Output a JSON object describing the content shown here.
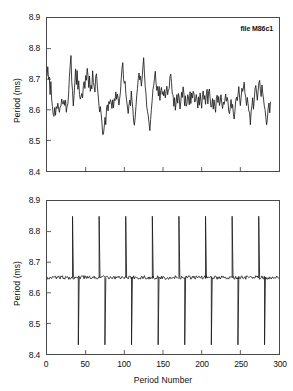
{
  "figure": {
    "background_color": "#ffffff",
    "line_color": "#1a1a1a",
    "axis_color": "#4a4a4a"
  },
  "annotation": {
    "file_label": "file M86c1"
  },
  "axis": {
    "y_title": "Period (ms)",
    "x_title": "Period Number",
    "y_ticks": [
      "8.9",
      "8.8",
      "8.7",
      "8.6",
      "8.5",
      "8.4"
    ],
    "x_ticks": [
      "0",
      "50",
      "100",
      "150",
      "200",
      "250",
      "300"
    ]
  },
  "chart_data": [
    {
      "type": "line",
      "panel": "top",
      "title": "",
      "annotation": "file M86c1",
      "xlabel": "",
      "ylabel": "Period (ms)",
      "xlim": [
        0,
        300
      ],
      "ylim": [
        8.4,
        8.9
      ],
      "yticks": [
        8.4,
        8.5,
        8.6,
        8.7,
        8.8,
        8.9
      ],
      "xticks": [
        0,
        50,
        100,
        150,
        200,
        250,
        300
      ],
      "xtick_labels_visible": false,
      "grid": false,
      "legend": "none",
      "description": "Noisy fluctuating period trace, mean near 8.64 ms, range 8.50 to 8.78 ms",
      "series": [
        {
          "name": "period",
          "x": [
            0,
            1,
            2,
            3,
            4,
            5,
            6,
            7,
            8,
            9,
            10,
            11,
            12,
            13,
            14,
            15,
            16,
            17,
            18,
            19,
            20,
            21,
            22,
            23,
            24,
            25,
            26,
            27,
            28,
            29,
            30,
            31,
            32,
            33,
            34,
            35,
            36,
            37,
            38,
            39,
            40,
            41,
            42,
            43,
            44,
            45,
            46,
            47,
            48,
            49,
            50,
            51,
            52,
            53,
            54,
            55,
            56,
            57,
            58,
            59,
            60,
            61,
            62,
            63,
            64,
            65,
            66,
            67,
            68,
            69,
            70,
            71,
            72,
            73,
            74,
            75,
            76,
            77,
            78,
            79,
            80,
            81,
            82,
            83,
            84,
            85,
            86,
            87,
            88,
            89,
            90,
            91,
            92,
            93,
            94,
            95,
            96,
            97,
            98,
            99,
            100,
            101,
            102,
            103,
            104,
            105,
            106,
            107,
            108,
            109,
            110,
            111,
            112,
            113,
            114,
            115,
            116,
            117,
            118,
            119,
            120,
            121,
            122,
            123,
            124,
            125,
            126,
            127,
            128,
            129,
            130,
            131,
            132,
            133,
            134,
            135,
            136,
            137,
            138,
            139,
            140,
            141,
            142,
            143,
            144,
            145,
            146,
            147,
            148,
            149,
            150,
            151,
            152,
            153,
            154,
            155,
            156,
            157,
            158,
            159,
            160,
            161,
            162,
            163,
            164,
            165,
            166,
            167,
            168,
            169,
            170,
            171,
            172,
            173,
            174,
            175,
            176,
            177,
            178,
            179,
            180,
            181,
            182,
            183,
            184,
            185,
            186,
            187,
            188,
            189,
            190,
            191,
            192,
            193,
            194,
            195,
            196,
            197,
            198,
            199,
            200,
            201,
            202,
            203,
            204,
            205,
            206,
            207,
            208,
            209,
            210,
            211,
            212,
            213,
            214,
            215,
            216,
            217,
            218,
            219,
            220,
            221,
            222,
            223,
            224,
            225,
            226,
            227,
            228,
            229,
            230,
            231,
            232,
            233,
            234,
            235,
            236,
            237,
            238,
            239,
            240,
            241,
            242,
            243,
            244,
            245,
            246,
            247,
            248,
            249,
            250,
            251,
            252,
            253,
            254,
            255,
            256,
            257,
            258,
            259,
            260,
            261,
            262,
            263,
            264,
            265,
            266,
            267,
            268,
            269,
            270,
            271,
            272,
            273,
            274,
            275,
            276,
            277,
            278,
            279,
            280,
            281,
            282,
            283,
            284,
            285,
            286,
            287,
            288,
            289,
            290,
            291,
            292,
            293,
            294,
            295,
            296,
            297,
            298,
            299
          ],
          "y": [
            8.7,
            8.73,
            8.69,
            8.71,
            8.66,
            8.7,
            8.64,
            8.62,
            8.59,
            8.57,
            8.6,
            8.58,
            8.62,
            8.6,
            8.63,
            8.61,
            8.6,
            8.62,
            8.61,
            8.63,
            8.62,
            8.61,
            8.63,
            8.62,
            8.64,
            8.6,
            8.62,
            8.61,
            8.66,
            8.71,
            8.74,
            8.77,
            8.7,
            8.66,
            8.62,
            8.65,
            8.7,
            8.73,
            8.68,
            8.72,
            8.67,
            8.7,
            8.66,
            8.63,
            8.64,
            8.66,
            8.63,
            8.67,
            8.7,
            8.68,
            8.72,
            8.7,
            8.73,
            8.71,
            8.68,
            8.7,
            8.66,
            8.69,
            8.67,
            8.72,
            8.7,
            8.68,
            8.66,
            8.7,
            8.72,
            8.68,
            8.65,
            8.62,
            8.6,
            8.62,
            8.58,
            8.55,
            8.52,
            8.51,
            8.55,
            8.58,
            8.56,
            8.6,
            8.62,
            8.59,
            8.63,
            8.61,
            8.64,
            8.62,
            8.6,
            8.63,
            8.61,
            8.64,
            8.62,
            8.65,
            8.63,
            8.66,
            8.64,
            8.61,
            8.63,
            8.66,
            8.7,
            8.73,
            8.76,
            8.71,
            8.68,
            8.7,
            8.66,
            8.63,
            8.6,
            8.58,
            8.61,
            8.64,
            8.62,
            8.66,
            8.63,
            8.6,
            8.57,
            8.54,
            8.58,
            8.62,
            8.65,
            8.68,
            8.7,
            8.72,
            8.69,
            8.71,
            8.67,
            8.7,
            8.73,
            8.76,
            8.72,
            8.68,
            8.65,
            8.62,
            8.6,
            8.58,
            8.55,
            8.53,
            8.57,
            8.6,
            8.63,
            8.66,
            8.68,
            8.7,
            8.72,
            8.69,
            8.66,
            8.68,
            8.65,
            8.67,
            8.64,
            8.66,
            8.68,
            8.65,
            8.67,
            8.64,
            8.66,
            8.63,
            8.65,
            8.67,
            8.64,
            8.66,
            8.68,
            8.7,
            8.72,
            8.69,
            8.66,
            8.64,
            8.61,
            8.63,
            8.6,
            8.62,
            8.65,
            8.63,
            8.66,
            8.64,
            8.61,
            8.63,
            8.66,
            8.64,
            8.67,
            8.65,
            8.62,
            8.64,
            8.61,
            8.63,
            8.66,
            8.64,
            8.62,
            8.65,
            8.63,
            8.66,
            8.64,
            8.67,
            8.65,
            8.62,
            8.64,
            8.66,
            8.63,
            8.61,
            8.64,
            8.62,
            8.65,
            8.63,
            8.61,
            8.64,
            8.66,
            8.63,
            8.65,
            8.62,
            8.64,
            8.66,
            8.63,
            8.65,
            8.67,
            8.64,
            8.62,
            8.6,
            8.63,
            8.61,
            8.64,
            8.62,
            8.6,
            8.63,
            8.65,
            8.62,
            8.64,
            8.61,
            8.63,
            8.65,
            8.62,
            8.6,
            8.63,
            8.61,
            8.64,
            8.66,
            8.63,
            8.65,
            8.62,
            8.6,
            8.58,
            8.61,
            8.63,
            8.6,
            8.62,
            8.59,
            8.57,
            8.6,
            8.62,
            8.65,
            8.63,
            8.66,
            8.68,
            8.65,
            8.62,
            8.64,
            8.67,
            8.65,
            8.68,
            8.7,
            8.66,
            8.63,
            8.61,
            8.64,
            8.62,
            8.6,
            8.58,
            8.56,
            8.59,
            8.62,
            8.64,
            8.61,
            8.63,
            8.66,
            8.68,
            8.65,
            8.63,
            8.66,
            8.68,
            8.7,
            8.67,
            8.65,
            8.68,
            8.66,
            8.63,
            8.61,
            8.59,
            8.57,
            8.55,
            8.58,
            8.61,
            8.63,
            8.6,
            8.62
          ]
        }
      ]
    },
    {
      "type": "line",
      "panel": "bottom",
      "title": "",
      "xlabel": "Period Number",
      "ylabel": "Period (ms)",
      "xlim": [
        0,
        300
      ],
      "ylim": [
        8.4,
        8.9
      ],
      "yticks": [
        8.4,
        8.5,
        8.6,
        8.7,
        8.8,
        8.9
      ],
      "xticks": [
        0,
        50,
        100,
        150,
        200,
        250,
        300
      ],
      "xtick_labels_visible": true,
      "grid": false,
      "legend": "none",
      "description": "Flat baseline near 8.65 ms with regular bipolar spikes reaching 8.85 ms up and 8.43 ms down, recurring roughly every 34 periods",
      "baseline": 8.65,
      "baseline_noise": 0.006,
      "spike_high": 8.85,
      "spike_low": 8.43,
      "spike_positions": [
        33,
        67,
        101,
        124,
        136,
        156,
        170,
        187,
        205,
        219,
        239,
        249,
        273,
        281
      ]
    }
  ]
}
